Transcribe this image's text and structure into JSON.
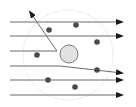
{
  "diagram": {
    "type": "particle-scattering",
    "colors": {
      "line": "#6b6b6b",
      "arrowhead": "#1a1a1a",
      "particle": "#4a4a4a",
      "nucleus_fill": "#e2e2e2",
      "nucleus_stroke": "#6b6b6b",
      "boundary": "#c8c8c8"
    },
    "boundary_circle": {
      "cx": 68,
      "cy": 55,
      "r": 45
    },
    "nucleus": {
      "cx": 69,
      "cy": 54,
      "r": 9
    },
    "particles": [
      {
        "cx": 49,
        "cy": 30
      },
      {
        "cx": 76,
        "cy": 25
      },
      {
        "cx": 97,
        "cy": 42
      },
      {
        "cx": 37,
        "cy": 55
      },
      {
        "cx": 97,
        "cy": 70
      },
      {
        "cx": 48,
        "cy": 80
      },
      {
        "cx": 75,
        "cy": 87
      }
    ],
    "trajectories": [
      {
        "name": "trajectory-1-straight",
        "points": "10,22 122,22"
      },
      {
        "name": "trajectory-2-straight",
        "points": "10,36 122,36"
      },
      {
        "name": "trajectory-3-backscattered",
        "points": "10,51 57,51 30,12"
      },
      {
        "name": "trajectory-4-deflected",
        "points": "10,66 60,66 122,73"
      },
      {
        "name": "trajectory-5-straight",
        "points": "10,80 122,80"
      },
      {
        "name": "trajectory-6-straight",
        "points": "10,95 122,95"
      }
    ]
  }
}
